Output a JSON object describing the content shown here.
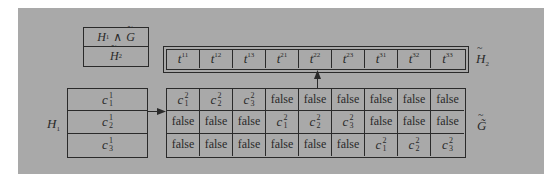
{
  "legend_box": {
    "top": "H1 ∧ G̃",
    "top_parts": {
      "h": "H",
      "h_sub": "1",
      "op": "∧",
      "g": "G"
    },
    "bottom": "H̃2",
    "bottom_parts": {
      "h": "H",
      "h_sub": "2"
    }
  },
  "h2_strip": {
    "label": "H̃2",
    "label_parts": {
      "h": "H",
      "h_sub": "2"
    },
    "cells": [
      {
        "v": "t",
        "sub": "11"
      },
      {
        "v": "t",
        "sub": "12"
      },
      {
        "v": "t",
        "sub": "13"
      },
      {
        "v": "t",
        "sub": "21"
      },
      {
        "v": "t",
        "sub": "22"
      },
      {
        "v": "t",
        "sub": "23"
      },
      {
        "v": "t",
        "sub": "31"
      },
      {
        "v": "t",
        "sub": "32"
      },
      {
        "v": "t",
        "sub": "33"
      }
    ],
    "pointed_cell_index": 4
  },
  "h1_table": {
    "label": "H1",
    "label_parts": {
      "h": "H",
      "h_sub": "1"
    },
    "rows": [
      {
        "v": "c",
        "sup": "1",
        "sub": "1"
      },
      {
        "v": "c",
        "sup": "1",
        "sub": "2"
      },
      {
        "v": "c",
        "sup": "1",
        "sub": "3"
      }
    ]
  },
  "g_table": {
    "label": "G̃",
    "rows": [
      [
        {
          "v": "c",
          "sup": "2",
          "sub": "1"
        },
        {
          "v": "c",
          "sup": "2",
          "sub": "2"
        },
        {
          "v": "c",
          "sup": "2",
          "sub": "3"
        },
        {
          "text": "false"
        },
        {
          "text": "false"
        },
        {
          "text": "false"
        },
        {
          "text": "false"
        },
        {
          "text": "false"
        },
        {
          "text": "false"
        }
      ],
      [
        {
          "text": "false"
        },
        {
          "text": "false"
        },
        {
          "text": "false"
        },
        {
          "v": "c",
          "sup": "2",
          "sub": "1"
        },
        {
          "v": "c",
          "sup": "2",
          "sub": "2"
        },
        {
          "v": "c",
          "sup": "2",
          "sub": "3"
        },
        {
          "text": "false"
        },
        {
          "text": "false"
        },
        {
          "text": "false"
        }
      ],
      [
        {
          "text": "false"
        },
        {
          "text": "false"
        },
        {
          "text": "false"
        },
        {
          "text": "false"
        },
        {
          "text": "false"
        },
        {
          "text": "false"
        },
        {
          "v": "c",
          "sup": "2",
          "sub": "1"
        },
        {
          "v": "c",
          "sup": "2",
          "sub": "2"
        },
        {
          "v": "c",
          "sup": "2",
          "sub": "3"
        }
      ]
    ]
  },
  "colors": {
    "background": "#a9a9a9",
    "line": "#2a2a2a",
    "page": "#ffffff"
  }
}
